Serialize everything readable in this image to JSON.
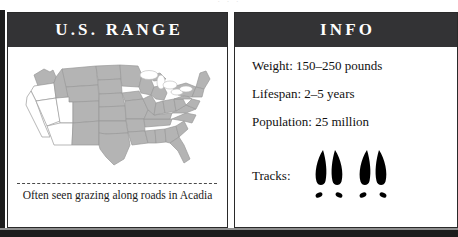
{
  "ghost": {
    "text": "· · ·"
  },
  "panels": {
    "range": {
      "title": "U.S. RANGE",
      "caption": "Often seen grazing along roads in Acadia",
      "map": {
        "name": "united-states-range-map",
        "shaded_color": "#b4b4b4",
        "unshaded_color": "#ffffff",
        "border_color": "#9a9a9a",
        "unshaded_regions": [
          "California",
          "Nevada",
          "Utah",
          "Arizona"
        ]
      }
    },
    "info": {
      "title": "INFO",
      "rows": [
        {
          "label": "Weight:",
          "value": "150–250 pounds",
          "text": "Weight: 150–250 pounds"
        },
        {
          "label": "Lifespan:",
          "value": "2–5 years",
          "text": "Lifespan: 2–5 years"
        },
        {
          "label": "Population:",
          "value": "25 million",
          "text": "Population: 25 million"
        }
      ],
      "tracks": {
        "label": "Tracks:",
        "icon": "hoof-print-icon",
        "count": 2,
        "color": "#000000"
      }
    }
  },
  "style": {
    "header_bg": "#333335",
    "header_fg": "#ffffff",
    "frame_color": "#1d1d1d",
    "page_bg": "#ffffff",
    "text_color": "#111111"
  }
}
